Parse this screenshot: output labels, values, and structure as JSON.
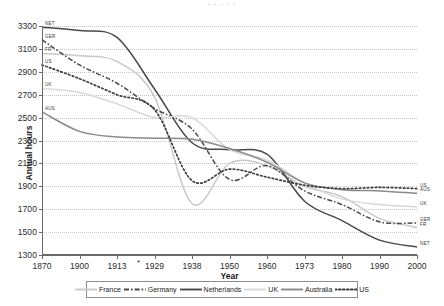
{
  "top_fragment": "·   ·      ·              ·                      ·",
  "axes": {
    "ylabel": "Annual hours",
    "xlabel": "Year",
    "yticks": [
      3300,
      3100,
      2900,
      2700,
      2500,
      2300,
      2100,
      1900,
      1700,
      1500,
      1300
    ],
    "xticks": [
      "1870",
      "1900",
      "1913",
      "1929",
      "1938",
      "1950",
      "1960",
      "1973",
      "1980",
      "1990",
      "2000"
    ],
    "footnote_marker": "*"
  },
  "legend": {
    "position": "bottom",
    "items": [
      {
        "label": "France",
        "color": "#c9c9c9",
        "style": "solid"
      },
      {
        "label": "Germany",
        "color": "#4a4a4a",
        "style": "dashdot"
      },
      {
        "label": "Netherlands",
        "color": "#4a4a4a",
        "style": "solid"
      },
      {
        "label": "UK",
        "color": "#d8d8d8",
        "style": "solid"
      },
      {
        "label": "Australia",
        "color": "#8a8a8a",
        "style": "solid"
      },
      {
        "label": "US",
        "color": "#3d3d3d",
        "style": "dotted"
      }
    ]
  },
  "start_labels": [
    {
      "text": "NET",
      "series": "Netherlands"
    },
    {
      "text": "GER",
      "series": "Germany"
    },
    {
      "text": "FR",
      "series": "France"
    },
    {
      "text": "US",
      "series": "US"
    },
    {
      "text": "UK",
      "series": "UK"
    },
    {
      "text": "AUS",
      "series": "Australia"
    }
  ],
  "end_labels": [
    {
      "text": "US",
      "series": "US"
    },
    {
      "text": "AUS",
      "series": "Australia"
    },
    {
      "text": "UK",
      "series": "UK"
    },
    {
      "text": "GER",
      "series": "Germany"
    },
    {
      "text": "FR",
      "series": "France"
    },
    {
      "text": "NET",
      "series": "Netherlands"
    }
  ],
  "chart_data": {
    "type": "line",
    "title": "",
    "xlabel": "Year",
    "ylabel": "Annual hours",
    "ylim": [
      1300,
      3300
    ],
    "ytick_step": 200,
    "grid": true,
    "x_axis_kind": "categorical",
    "categories": [
      "1870",
      "1900",
      "1913",
      "1929",
      "1938",
      "1950",
      "1960",
      "1973",
      "1980",
      "1990",
      "2000"
    ],
    "series": [
      {
        "name": "France",
        "color": "#c9c9c9",
        "style": "solid",
        "values": [
          3060,
          3040,
          2990,
          2680,
          1750,
          2100,
          2080,
          1900,
          1810,
          1620,
          1540
        ]
      },
      {
        "name": "Germany",
        "color": "#4a4a4a",
        "style": "dashdot",
        "values": [
          3180,
          2960,
          2800,
          2580,
          2400,
          1960,
          2080,
          1860,
          1740,
          1590,
          1580
        ]
      },
      {
        "name": "Netherlands",
        "color": "#4a4a4a",
        "style": "solid",
        "values": [
          3290,
          3260,
          3200,
          2750,
          2280,
          2220,
          2180,
          1770,
          1600,
          1430,
          1370
        ]
      },
      {
        "name": "UK",
        "color": "#d8d8d8",
        "style": "solid",
        "values": [
          2755,
          2720,
          2620,
          2500,
          2500,
          2220,
          2130,
          1930,
          1790,
          1740,
          1720
        ]
      },
      {
        "name": "Australia",
        "color": "#8a8a8a",
        "style": "solid",
        "values": [
          2550,
          2380,
          2330,
          2320,
          2310,
          2230,
          2110,
          1930,
          1870,
          1860,
          1840
        ]
      },
      {
        "name": "US",
        "color": "#3d3d3d",
        "style": "dotted",
        "values": [
          2960,
          2840,
          2700,
          2570,
          1950,
          2050,
          1980,
          1910,
          1880,
          1890,
          1880
        ]
      }
    ]
  }
}
